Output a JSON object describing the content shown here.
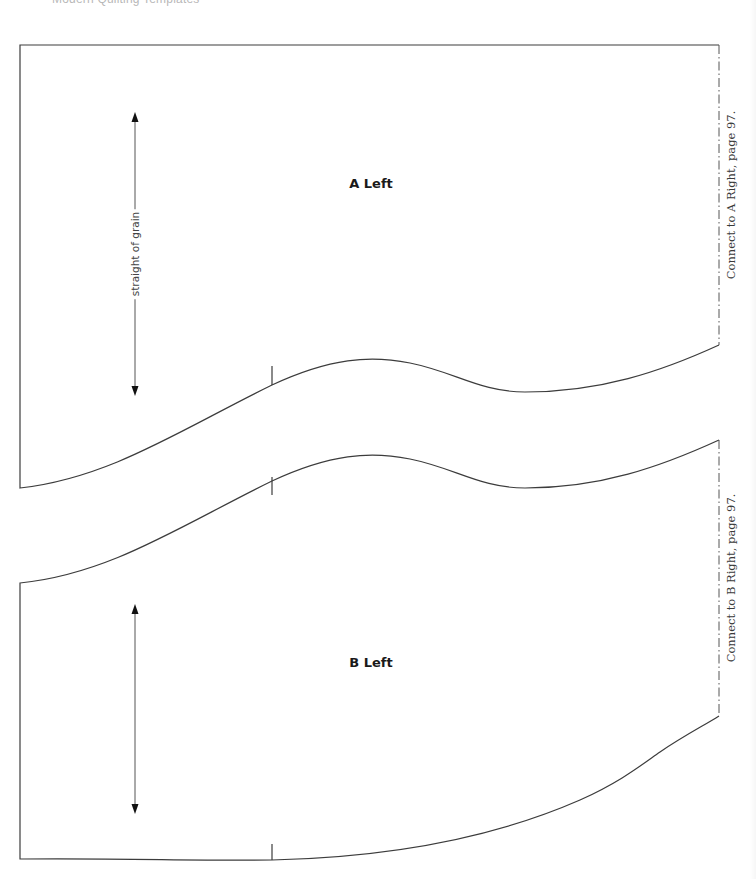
{
  "header": {
    "title": "Modern Quilting Templates"
  },
  "pieces": [
    {
      "id": "a-left",
      "label": "A Left",
      "grainline_label": "straight of grain",
      "connect_note": "Connect to A Right, page 97."
    },
    {
      "id": "b-left",
      "label": "B Left",
      "grainline_label": "",
      "connect_note": "Connect to B Right, page 97."
    }
  ],
  "colors": {
    "outline": "#3c3c3c",
    "text": "#1a1a1a",
    "muted_text": "#b8b8b8"
  }
}
